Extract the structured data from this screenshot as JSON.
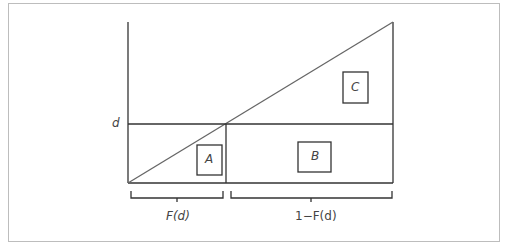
{
  "diagram": {
    "y_label": "d",
    "regions": [
      {
        "id": "A",
        "label": "A"
      },
      {
        "id": "B",
        "label": "B"
      },
      {
        "id": "C",
        "label": "C"
      }
    ],
    "braces": [
      {
        "label": "F(d)"
      },
      {
        "label": "1−F(d)"
      }
    ]
  }
}
